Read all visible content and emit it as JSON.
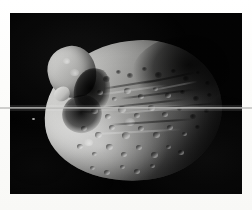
{
  "page": {
    "background_color": "#fdfdfb",
    "width": 252,
    "height": 210
  },
  "photo": {
    "name": "planetary-moon-photograph",
    "subject": "irregular cratered moon",
    "color_mode": "grayscale",
    "background_color": "#020202",
    "frame": {
      "left": 10,
      "top": 13,
      "width": 232,
      "height": 181
    },
    "illumination": "lit from lower-left, terminator across upper-right",
    "alt_text": "Grayscale spacecraft photograph of an irregular, heavily cratered moon against black space"
  },
  "features": {
    "main_body_label": "cratered main body",
    "bright_lobe_label": "illuminated upper-left lobe",
    "shadow_limb_label": "shadowed upper-right limb",
    "terminator_label": "terminator",
    "speck_label": "bright speck artifact"
  },
  "artifacts": {
    "scanline_label": "horizontal scan line artifact",
    "scanline_y": 107,
    "grain_label": "film grain"
  },
  "craters": [
    {
      "x": 96,
      "y": 66,
      "d": 7,
      "style": "dark"
    },
    {
      "x": 108,
      "y": 59,
      "d": 5,
      "style": "dark"
    },
    {
      "x": 120,
      "y": 63,
      "d": 6,
      "style": "dark"
    },
    {
      "x": 134,
      "y": 56,
      "d": 5,
      "style": "dark"
    },
    {
      "x": 148,
      "y": 62,
      "d": 7,
      "style": "dark"
    },
    {
      "x": 163,
      "y": 58,
      "d": 5,
      "style": "dark"
    },
    {
      "x": 176,
      "y": 66,
      "d": 6,
      "style": "dark"
    },
    {
      "x": 188,
      "y": 60,
      "d": 4,
      "style": "dark"
    },
    {
      "x": 197,
      "y": 70,
      "d": 5,
      "style": "dark"
    },
    {
      "x": 90,
      "y": 80,
      "d": 6,
      "style": "lit"
    },
    {
      "x": 104,
      "y": 86,
      "d": 5,
      "style": "lit"
    },
    {
      "x": 117,
      "y": 78,
      "d": 7,
      "style": "lit"
    },
    {
      "x": 131,
      "y": 84,
      "d": 6,
      "style": "lit"
    },
    {
      "x": 145,
      "y": 76,
      "d": 5,
      "style": "lit"
    },
    {
      "x": 158,
      "y": 83,
      "d": 6,
      "style": "lit"
    },
    {
      "x": 172,
      "y": 79,
      "d": 5,
      "style": "dark"
    },
    {
      "x": 186,
      "y": 86,
      "d": 6,
      "style": "dark"
    },
    {
      "x": 199,
      "y": 82,
      "d": 5,
      "style": "dark"
    },
    {
      "x": 84,
      "y": 98,
      "d": 7,
      "style": "lit"
    },
    {
      "x": 98,
      "y": 104,
      "d": 6,
      "style": "lit"
    },
    {
      "x": 112,
      "y": 97,
      "d": 8,
      "style": "lit"
    },
    {
      "x": 127,
      "y": 103,
      "d": 6,
      "style": "lit"
    },
    {
      "x": 141,
      "y": 95,
      "d": 7,
      "style": "lit"
    },
    {
      "x": 155,
      "y": 102,
      "d": 6,
      "style": "lit"
    },
    {
      "x": 169,
      "y": 96,
      "d": 5,
      "style": "dark"
    },
    {
      "x": 183,
      "y": 104,
      "d": 6,
      "style": "dark"
    },
    {
      "x": 196,
      "y": 98,
      "d": 5,
      "style": "dark"
    },
    {
      "x": 74,
      "y": 116,
      "d": 6,
      "style": "lit"
    },
    {
      "x": 88,
      "y": 122,
      "d": 7,
      "style": "lit"
    },
    {
      "x": 102,
      "y": 115,
      "d": 6,
      "style": "lit"
    },
    {
      "x": 116,
      "y": 123,
      "d": 8,
      "style": "lit"
    },
    {
      "x": 131,
      "y": 116,
      "d": 6,
      "style": "lit"
    },
    {
      "x": 146,
      "y": 122,
      "d": 7,
      "style": "lit"
    },
    {
      "x": 160,
      "y": 115,
      "d": 6,
      "style": "lit"
    },
    {
      "x": 174,
      "y": 121,
      "d": 5,
      "style": "lit"
    },
    {
      "x": 187,
      "y": 114,
      "d": 5,
      "style": "dark"
    },
    {
      "x": 70,
      "y": 134,
      "d": 6,
      "style": "lit"
    },
    {
      "x": 84,
      "y": 141,
      "d": 5,
      "style": "lit"
    },
    {
      "x": 99,
      "y": 134,
      "d": 7,
      "style": "lit"
    },
    {
      "x": 114,
      "y": 142,
      "d": 6,
      "style": "lit"
    },
    {
      "x": 129,
      "y": 135,
      "d": 6,
      "style": "lit"
    },
    {
      "x": 144,
      "y": 142,
      "d": 7,
      "style": "lit"
    },
    {
      "x": 158,
      "y": 134,
      "d": 5,
      "style": "lit"
    },
    {
      "x": 171,
      "y": 140,
      "d": 6,
      "style": "lit"
    },
    {
      "x": 82,
      "y": 155,
      "d": 5,
      "style": "lit"
    },
    {
      "x": 97,
      "y": 160,
      "d": 6,
      "style": "lit"
    },
    {
      "x": 112,
      "y": 154,
      "d": 5,
      "style": "lit"
    },
    {
      "x": 127,
      "y": 159,
      "d": 6,
      "style": "lit"
    },
    {
      "x": 142,
      "y": 153,
      "d": 5,
      "style": "lit"
    },
    {
      "x": 64,
      "y": 60,
      "d": 9,
      "style": "bright"
    },
    {
      "x": 56,
      "y": 48,
      "d": 7,
      "style": "bright"
    },
    {
      "x": 78,
      "y": 130,
      "d": 9,
      "style": "bright"
    },
    {
      "x": 120,
      "y": 110,
      "d": 10,
      "style": "bright"
    }
  ],
  "grooves": [
    {
      "x": 92,
      "y": 70,
      "w": 62,
      "h": 2,
      "rot": -9
    },
    {
      "x": 110,
      "y": 80,
      "w": 76,
      "h": 2,
      "rot": -7
    },
    {
      "x": 86,
      "y": 90,
      "w": 92,
      "h": 2,
      "rot": -6
    },
    {
      "x": 130,
      "y": 64,
      "w": 58,
      "h": 2,
      "rot": -12
    },
    {
      "x": 150,
      "y": 92,
      "w": 54,
      "h": 2,
      "rot": -5
    },
    {
      "x": 100,
      "y": 108,
      "w": 84,
      "h": 2,
      "rot": -4
    }
  ],
  "ridges": [
    {
      "x": 88,
      "y": 76,
      "w": 70,
      "h": 2,
      "rot": -8
    },
    {
      "x": 104,
      "y": 96,
      "w": 86,
      "h": 2,
      "rot": -5
    },
    {
      "x": 76,
      "y": 118,
      "w": 96,
      "h": 2,
      "rot": -3
    },
    {
      "x": 140,
      "y": 72,
      "w": 48,
      "h": 2,
      "rot": -11
    }
  ]
}
